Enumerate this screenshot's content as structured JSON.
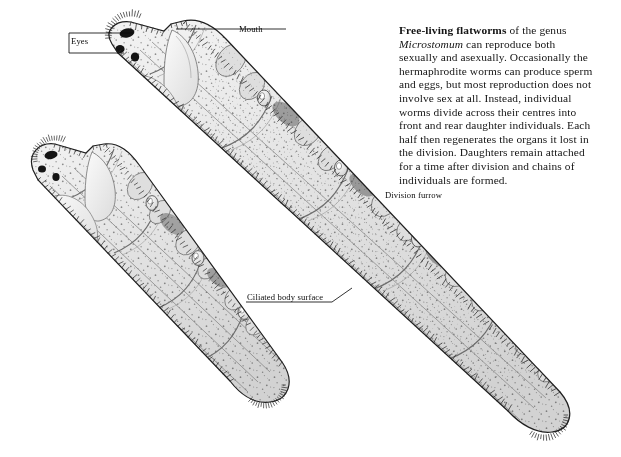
{
  "figure": {
    "kind": "scientific-illustration",
    "background_color": "#ffffff",
    "ink_color": "#1b1b1b",
    "body_fill": "#e9e9e9"
  },
  "caption": {
    "lead_bold": "Free-living flatworms",
    "rest_1": " of the genus ",
    "genus_italic": "Microstomum",
    "rest_2": " can reproduce both sexually and asexually. Occasionally the hermaphrodite worms can produce sperm and eggs, but most reproduction does not involve sex at all. Instead, individual worms divide across their centres into front and rear daughter individuals. Each half then regenerates the organs it lost in the division. Daughters remain attached for a time after division and chains of individuals are formed."
  },
  "labels": {
    "eyes": "Eyes",
    "mouth": "Mouth",
    "division_furrow": "Division furrow",
    "ciliated_body_surface": "Ciliated body surface"
  },
  "anatomy": {
    "eye_spot_count": 2,
    "worm_count": 2,
    "chain_segments_upper": 5,
    "chain_segments_lower": 4
  }
}
